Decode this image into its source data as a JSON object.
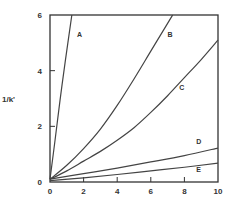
{
  "chart_data": {
    "type": "line",
    "title": "",
    "xlabel": "",
    "ylabel": "1/k'",
    "xlim": [
      0,
      10
    ],
    "ylim": [
      0,
      6
    ],
    "xticks": [
      0,
      2,
      4,
      6,
      8,
      10
    ],
    "yticks": [
      0,
      2,
      4,
      6
    ],
    "xtick_labels": [
      "0",
      "2",
      "4",
      "6",
      "8",
      "10"
    ],
    "ytick_labels": [
      "0",
      "2",
      "4",
      "6"
    ],
    "grid": false,
    "legend": "inline labels",
    "series": [
      {
        "name": "A",
        "x": [
          0,
          0.3,
          0.6,
          0.9,
          1.3
        ],
        "y": [
          0.1,
          1.5,
          2.95,
          4.3,
          6.0
        ],
        "label_pos": [
          1.6,
          5.2
        ]
      },
      {
        "name": "B",
        "x": [
          0,
          1,
          2,
          3,
          4,
          5,
          6,
          7,
          7.3
        ],
        "y": [
          0.1,
          0.6,
          1.2,
          1.9,
          2.75,
          3.7,
          4.7,
          5.7,
          6.0
        ],
        "label_pos": [
          7.0,
          5.2
        ]
      },
      {
        "name": "C",
        "x": [
          0,
          1,
          2,
          3,
          4,
          5,
          6,
          7,
          8,
          9,
          10
        ],
        "y": [
          0.1,
          0.4,
          0.75,
          1.1,
          1.5,
          1.95,
          2.5,
          3.1,
          3.75,
          4.4,
          5.1
        ],
        "label_pos": [
          7.7,
          3.3
        ]
      },
      {
        "name": "D",
        "x": [
          0,
          2,
          4,
          6,
          8,
          10
        ],
        "y": [
          0.1,
          0.3,
          0.5,
          0.72,
          0.95,
          1.22
        ],
        "label_pos": [
          8.7,
          1.35
        ]
      },
      {
        "name": "E",
        "x": [
          0,
          2,
          4,
          6,
          8,
          10
        ],
        "y": [
          0.05,
          0.15,
          0.27,
          0.4,
          0.53,
          0.68
        ],
        "label_pos": [
          8.7,
          0.35
        ]
      }
    ]
  }
}
